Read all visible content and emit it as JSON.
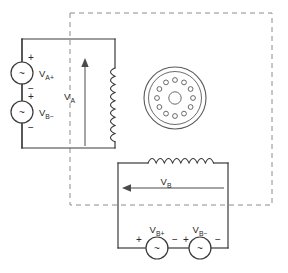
{
  "diagram": {
    "background_color": "#ffffff",
    "wire_color": "#3a3a3a",
    "boundary_color": "#8c8c8c"
  },
  "boundary": {
    "name": "machine-boundary",
    "style": "dashed"
  },
  "left_circuit": {
    "name": "left-loop",
    "sources": [
      {
        "id": "source-va-plus",
        "label_main": "V",
        "label_sub": "A+",
        "symbol": "~",
        "top_sign": "+",
        "bottom_sign": "−"
      },
      {
        "id": "source-vb-minus",
        "label_main": "V",
        "label_sub": "B−",
        "symbol": "~",
        "top_sign": "+",
        "bottom_sign": "−"
      }
    ],
    "winding": {
      "id": "winding-a",
      "orientation": "vertical",
      "turns": 9
    },
    "arrow": {
      "id": "arrow-va",
      "direction": "up",
      "label_main": "V",
      "label_sub": "A"
    }
  },
  "bottom_circuit": {
    "name": "bottom-loop",
    "sources": [
      {
        "id": "source-vb-plus",
        "label_main": "V",
        "label_sub": "B+",
        "symbol": "~",
        "left_sign": "+",
        "right_sign": "−"
      },
      {
        "id": "source-vb-minus-2",
        "label_main": "V",
        "label_sub": "B−",
        "symbol": "~",
        "left_sign": "+",
        "right_sign": "−"
      }
    ],
    "winding": {
      "id": "winding-b",
      "orientation": "horizontal",
      "turns": 8
    },
    "arrow": {
      "id": "arrow-vb",
      "direction": "left",
      "label_main": "V",
      "label_sub": "B"
    }
  },
  "machine": {
    "name": "machine-cross-section",
    "slot_count": 12,
    "has_center_bore": true
  }
}
